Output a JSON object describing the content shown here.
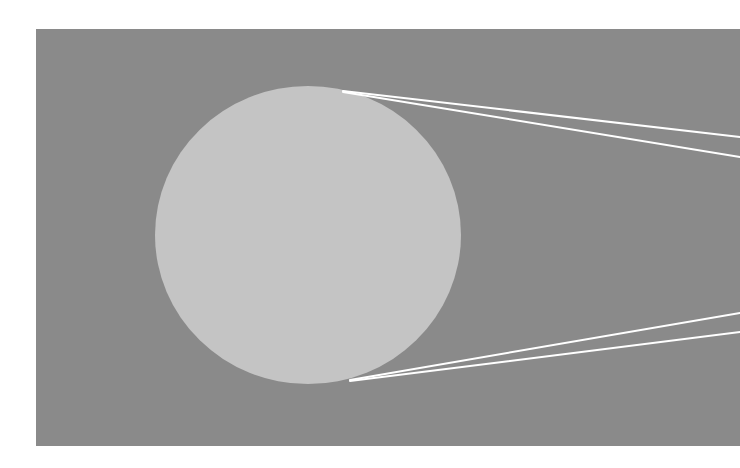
{
  "diagram": {
    "colors": {
      "page_background": "#ffffff",
      "panel": "#8a8a8a",
      "circle": "#c4c4c4",
      "lines": "#ffffff"
    },
    "panel": {
      "x": 36,
      "y": 29,
      "width": 704,
      "height": 417
    },
    "circle": {
      "cx": 308,
      "cy": 235,
      "rx": 153,
      "ry": 149
    },
    "lines": [
      {
        "id": "top-line-1",
        "x1": 343,
        "y1": 91,
        "x2": 740,
        "y2": 137
      },
      {
        "id": "top-line-2",
        "x1": 343,
        "y1": 92,
        "x2": 740,
        "y2": 157
      },
      {
        "id": "bottom-line-1",
        "x1": 350,
        "y1": 380,
        "x2": 740,
        "y2": 313
      },
      {
        "id": "bottom-line-2",
        "x1": 350,
        "y1": 381,
        "x2": 740,
        "y2": 332
      }
    ],
    "stroke_width": 2
  }
}
